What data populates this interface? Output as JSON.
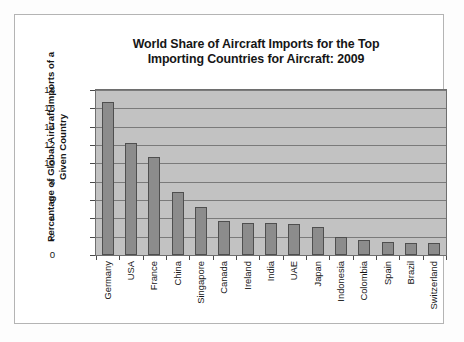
{
  "chart_data": {
    "type": "bar",
    "title": "World Share of Aircraft Imports for the Top Importing Countries for Aircraft: 2009",
    "title_line1": "World Share of Aircraft Imports for the Top",
    "title_line2": "Importing Countries for Aircraft: 2009",
    "xlabel": "",
    "ylabel": "Percentage of Global Aircraft Imports of a Given Country",
    "ylabel_line1": "Percentage of Global Aircraft Imports of a",
    "ylabel_line2": "Given Country",
    "ylim": [
      0,
      18
    ],
    "ytick_step": 2,
    "yticks": [
      "18",
      "16",
      "14",
      "12",
      "10",
      "8",
      "6",
      "4",
      "2",
      "0"
    ],
    "grid": true,
    "legend": false,
    "categories": [
      "Germany",
      "USA",
      "France",
      "China",
      "Singapore",
      "Canada",
      "Ireland",
      "India",
      "UAE",
      "Japan",
      "Indonesia",
      "Colombia",
      "Spain",
      "Brazil",
      "Switzerland"
    ],
    "values": [
      16.7,
      12.2,
      10.7,
      6.9,
      5.2,
      3.7,
      3.5,
      3.45,
      3.4,
      3.1,
      2.0,
      1.6,
      1.4,
      1.35,
      1.3
    ],
    "colors": {
      "bar_fill": "#8c8c8c",
      "bar_border": "#4f4f4f",
      "plot_background": "#c2c2c2",
      "gridline": "#7a7a7a",
      "axis": "#4a4a4a",
      "text": "#161616",
      "page_background": "#ffffff",
      "frame_border": "#b4b4b4"
    }
  }
}
